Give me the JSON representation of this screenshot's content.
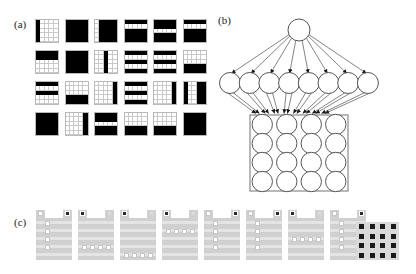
{
  "figure": {
    "panels": [
      {
        "id": "a",
        "label": "(a)"
      },
      {
        "id": "b",
        "label": "(b)"
      },
      {
        "id": "c",
        "label": "(c)"
      }
    ]
  },
  "panel_a": {
    "label": "(a)",
    "description": "6 by 4 array of binary 5x5 receptive-field patterns",
    "columns": 6,
    "rows": 4,
    "tile_grid": 5,
    "on_color": "#000000",
    "off_color": "#ffffff",
    "grid_line_color": "#c9c9c9",
    "tiles": [
      {
        "index": 1,
        "pattern": [
          [
            1,
            0,
            0,
            0,
            0
          ],
          [
            1,
            0,
            0,
            0,
            0
          ],
          [
            1,
            0,
            0,
            0,
            0
          ],
          [
            1,
            0,
            0,
            0,
            0
          ],
          [
            1,
            0,
            0,
            0,
            0
          ]
        ]
      },
      {
        "index": 2,
        "pattern": [
          [
            1,
            1,
            1,
            1,
            1
          ],
          [
            1,
            1,
            1,
            1,
            1
          ],
          [
            1,
            1,
            1,
            1,
            1
          ],
          [
            1,
            1,
            1,
            1,
            1
          ],
          [
            1,
            1,
            1,
            1,
            1
          ]
        ]
      },
      {
        "index": 3,
        "pattern": [
          [
            0,
            1,
            1,
            1,
            1
          ],
          [
            0,
            1,
            1,
            1,
            1
          ],
          [
            0,
            1,
            1,
            1,
            1
          ],
          [
            0,
            1,
            1,
            1,
            1
          ],
          [
            0,
            1,
            1,
            1,
            1
          ]
        ]
      },
      {
        "index": 4,
        "pattern": [
          [
            1,
            1,
            1,
            1,
            1
          ],
          [
            0,
            0,
            0,
            0,
            0
          ],
          [
            1,
            1,
            1,
            1,
            1
          ],
          [
            1,
            1,
            1,
            1,
            1
          ],
          [
            1,
            1,
            1,
            1,
            1
          ]
        ]
      },
      {
        "index": 5,
        "pattern": [
          [
            1,
            1,
            1,
            1,
            1
          ],
          [
            1,
            1,
            1,
            1,
            1
          ],
          [
            0,
            0,
            0,
            0,
            0
          ],
          [
            1,
            1,
            1,
            1,
            1
          ],
          [
            1,
            1,
            1,
            1,
            1
          ]
        ]
      },
      {
        "index": 6,
        "pattern": [
          [
            1,
            1,
            1,
            1,
            1
          ],
          [
            0,
            0,
            0,
            0,
            0
          ],
          [
            1,
            1,
            1,
            1,
            1
          ],
          [
            1,
            1,
            1,
            1,
            1
          ],
          [
            1,
            1,
            1,
            1,
            1
          ]
        ]
      },
      {
        "index": 7,
        "pattern": [
          [
            1,
            1,
            1,
            1,
            1
          ],
          [
            1,
            1,
            1,
            1,
            1
          ],
          [
            0,
            0,
            0,
            0,
            0
          ],
          [
            0,
            0,
            0,
            0,
            0
          ],
          [
            0,
            0,
            0,
            0,
            0
          ]
        ]
      },
      {
        "index": 8,
        "pattern": [
          [
            1,
            1,
            1,
            1,
            1
          ],
          [
            1,
            1,
            1,
            1,
            1
          ],
          [
            1,
            1,
            1,
            1,
            1
          ],
          [
            1,
            1,
            1,
            1,
            1
          ],
          [
            1,
            1,
            1,
            1,
            1
          ]
        ]
      },
      {
        "index": 9,
        "pattern": [
          [
            0,
            0,
            1,
            0,
            0
          ],
          [
            0,
            0,
            1,
            0,
            0
          ],
          [
            0,
            0,
            1,
            0,
            0
          ],
          [
            0,
            0,
            1,
            0,
            0
          ],
          [
            0,
            0,
            1,
            0,
            0
          ]
        ]
      },
      {
        "index": 10,
        "pattern": [
          [
            1,
            1,
            1,
            1,
            1
          ],
          [
            0,
            0,
            0,
            0,
            0
          ],
          [
            1,
            1,
            1,
            1,
            1
          ],
          [
            0,
            0,
            0,
            0,
            0
          ],
          [
            1,
            1,
            1,
            1,
            1
          ]
        ]
      },
      {
        "index": 11,
        "pattern": [
          [
            1,
            1,
            1,
            1,
            1
          ],
          [
            0,
            0,
            0,
            0,
            0
          ],
          [
            1,
            1,
            1,
            1,
            1
          ],
          [
            0,
            0,
            0,
            0,
            0
          ],
          [
            1,
            1,
            1,
            1,
            1
          ]
        ]
      },
      {
        "index": 12,
        "pattern": [
          [
            0,
            0,
            0,
            0,
            0
          ],
          [
            0,
            0,
            0,
            0,
            0
          ],
          [
            0,
            0,
            0,
            0,
            0
          ],
          [
            1,
            1,
            1,
            1,
            1
          ],
          [
            1,
            1,
            1,
            1,
            1
          ]
        ]
      },
      {
        "index": 13,
        "pattern": [
          [
            1,
            1,
            1,
            1,
            1
          ],
          [
            0,
            0,
            0,
            0,
            0
          ],
          [
            1,
            1,
            1,
            1,
            1
          ],
          [
            0,
            0,
            0,
            0,
            0
          ],
          [
            0,
            0,
            0,
            0,
            0
          ]
        ]
      },
      {
        "index": 14,
        "pattern": [
          [
            0,
            0,
            0,
            0,
            0
          ],
          [
            0,
            0,
            0,
            0,
            0
          ],
          [
            0,
            0,
            0,
            0,
            0
          ],
          [
            1,
            1,
            1,
            1,
            1
          ],
          [
            1,
            1,
            1,
            1,
            1
          ]
        ]
      },
      {
        "index": 15,
        "pattern": [
          [
            0,
            0,
            0,
            0,
            1
          ],
          [
            0,
            0,
            0,
            0,
            1
          ],
          [
            0,
            0,
            0,
            0,
            1
          ],
          [
            0,
            0,
            0,
            0,
            1
          ],
          [
            0,
            0,
            0,
            0,
            1
          ]
        ]
      },
      {
        "index": 16,
        "pattern": [
          [
            1,
            1,
            1,
            1,
            1
          ],
          [
            0,
            0,
            0,
            0,
            0
          ],
          [
            1,
            1,
            1,
            1,
            1
          ],
          [
            0,
            0,
            0,
            0,
            0
          ],
          [
            1,
            1,
            1,
            1,
            1
          ]
        ]
      },
      {
        "index": 17,
        "pattern": [
          [
            0,
            0,
            0,
            0,
            1
          ],
          [
            0,
            0,
            0,
            0,
            1
          ],
          [
            0,
            0,
            0,
            0,
            1
          ],
          [
            0,
            0,
            0,
            0,
            1
          ],
          [
            0,
            0,
            0,
            0,
            1
          ]
        ]
      },
      {
        "index": 18,
        "pattern": [
          [
            1,
            0,
            0,
            1,
            1
          ],
          [
            1,
            0,
            0,
            1,
            1
          ],
          [
            1,
            0,
            0,
            1,
            1
          ],
          [
            1,
            0,
            0,
            1,
            1
          ],
          [
            1,
            0,
            0,
            1,
            1
          ]
        ]
      },
      {
        "index": 19,
        "pattern": [
          [
            1,
            1,
            1,
            1,
            1
          ],
          [
            1,
            1,
            1,
            1,
            1
          ],
          [
            1,
            1,
            1,
            1,
            1
          ],
          [
            1,
            1,
            1,
            1,
            1
          ],
          [
            1,
            1,
            1,
            1,
            1
          ]
        ]
      },
      {
        "index": 20,
        "pattern": [
          [
            0,
            0,
            0,
            0,
            1
          ],
          [
            0,
            0,
            0,
            0,
            1
          ],
          [
            0,
            0,
            0,
            0,
            1
          ],
          [
            0,
            0,
            0,
            0,
            1
          ],
          [
            0,
            0,
            0,
            0,
            1
          ]
        ]
      },
      {
        "index": 21,
        "pattern": [
          [
            1,
            1,
            1,
            1,
            1
          ],
          [
            1,
            1,
            1,
            1,
            1
          ],
          [
            0,
            0,
            0,
            0,
            0
          ],
          [
            1,
            1,
            1,
            1,
            1
          ],
          [
            1,
            1,
            1,
            1,
            1
          ]
        ]
      },
      {
        "index": 22,
        "pattern": [
          [
            0,
            0,
            0,
            0,
            0
          ],
          [
            0,
            0,
            0,
            0,
            0
          ],
          [
            0,
            0,
            0,
            0,
            0
          ],
          [
            1,
            1,
            1,
            1,
            1
          ],
          [
            1,
            1,
            1,
            1,
            1
          ]
        ]
      },
      {
        "index": 23,
        "pattern": [
          [
            0,
            0,
            0,
            0,
            0
          ],
          [
            0,
            0,
            0,
            0,
            0
          ],
          [
            0,
            0,
            0,
            0,
            0
          ],
          [
            1,
            1,
            1,
            1,
            1
          ],
          [
            1,
            1,
            1,
            1,
            1
          ]
        ]
      },
      {
        "index": 24,
        "pattern": [
          [
            1,
            1,
            1,
            1,
            1
          ],
          [
            1,
            1,
            1,
            1,
            1
          ],
          [
            1,
            1,
            1,
            1,
            1
          ],
          [
            1,
            1,
            1,
            1,
            1
          ],
          [
            1,
            1,
            1,
            1,
            1
          ]
        ]
      }
    ]
  },
  "panel_b": {
    "label": "(b)",
    "description": "Hierarchical network: one top node projecting to eight hidden nodes which project to a 4x4 input grid",
    "top_nodes": 1,
    "middle_nodes": 8,
    "input_grid_rows": 4,
    "input_grid_cols": 4,
    "input_node_count": 16,
    "node_stroke": "#555555",
    "edge_stroke": "#666666",
    "box_stroke": "#999999",
    "arrowheads": true
  },
  "panel_c": {
    "label": "(c)",
    "description": "Eight receptive-field unit diagrams followed by a 4x4 dot array",
    "unit_count": 8,
    "body_color": "#d0d0d0",
    "stripe_color": "#e4e4e4",
    "active_square_color": "#2a2a2a",
    "inactive_square_color": "#ffffff",
    "units": [
      {
        "index": 1,
        "top_left": "light",
        "top_right": "dark",
        "column_squares": [
          1,
          2,
          3,
          4
        ],
        "row_bar": null
      },
      {
        "index": 2,
        "top_left": "dark",
        "top_right": "faint",
        "column_squares": [],
        "row_bar": 3
      },
      {
        "index": 3,
        "top_left": "dark",
        "top_right": "faint",
        "column_squares": [],
        "row_bar": 4
      },
      {
        "index": 4,
        "top_left": "dark",
        "top_right": "faint",
        "column_squares": [],
        "row_bar": 1
      },
      {
        "index": 5,
        "top_left": "light",
        "top_right": "dark",
        "column_squares": [
          1,
          2,
          3,
          4
        ],
        "row_bar": null
      },
      {
        "index": 6,
        "top_left": "light",
        "top_right": "dark",
        "column_squares": [
          1,
          2,
          3,
          4
        ],
        "row_bar": null
      },
      {
        "index": 7,
        "top_left": "dark",
        "top_right": "faint",
        "column_squares": [],
        "row_bar": 2
      },
      {
        "index": 8,
        "top_left": "light",
        "top_right": "dark",
        "column_squares": [
          1,
          2,
          3,
          4
        ],
        "row_bar": null
      }
    ],
    "dot_array": {
      "rows": 4,
      "cols": 4,
      "dot_color": "#1a1a1a",
      "background": "#d9d9d9"
    }
  }
}
